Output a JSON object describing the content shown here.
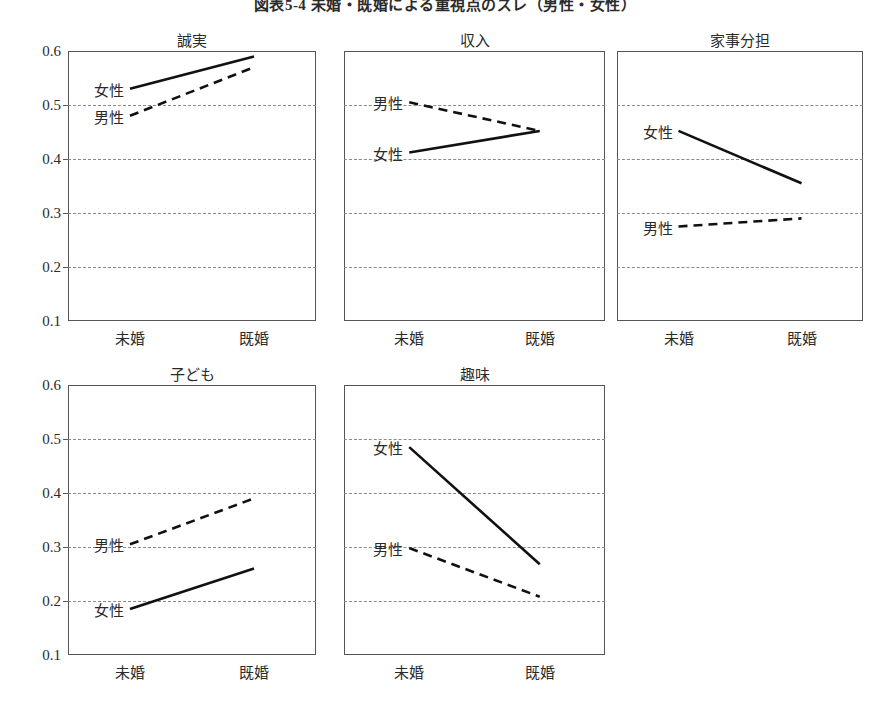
{
  "figure": {
    "title": "図表5-4 未婚・既婚による重視点のズレ（男性・女性）",
    "title_visible": "図表5-4 未婚・既婚による重視点のズレ（男性・女性）"
  },
  "axis": {
    "y_ticks": [
      "0.6",
      "0.5",
      "0.4",
      "0.3",
      "0.2",
      "0.1"
    ],
    "y_values": [
      0.6,
      0.5,
      0.4,
      0.3,
      0.2,
      0.1
    ],
    "y_min": 0.1,
    "y_max": 0.6,
    "x_categories": [
      "未婚",
      "既婚"
    ]
  },
  "series_names": {
    "female": "女性",
    "male": "男性"
  },
  "chart_data": {
    "type": "line",
    "title": "図表5-4 未婚・既婚による重視点のズレ（男性・女性）",
    "xlabel": "",
    "ylabel": "",
    "ylim": [
      0.1,
      0.6
    ],
    "grid": true,
    "legend_position": "inline-labels",
    "categories": [
      "未婚",
      "既婚"
    ],
    "panels": [
      {
        "title": "誠実",
        "series": [
          {
            "name": "女性",
            "style": "solid",
            "values": [
              0.53,
              0.59
            ]
          },
          {
            "name": "男性",
            "style": "dashed",
            "values": [
              0.48,
              0.57
            ]
          }
        ]
      },
      {
        "title": "収入",
        "series": [
          {
            "name": "男性",
            "style": "dashed",
            "values": [
              0.505,
              0.452
            ]
          },
          {
            "name": "女性",
            "style": "solid",
            "values": [
              0.412,
              0.452
            ]
          }
        ]
      },
      {
        "title": "家事分担",
        "series": [
          {
            "name": "女性",
            "style": "solid",
            "values": [
              0.452,
              0.355
            ]
          },
          {
            "name": "男性",
            "style": "dashed",
            "values": [
              0.275,
              0.29
            ]
          }
        ]
      },
      {
        "title": "子ども",
        "series": [
          {
            "name": "男性",
            "style": "dashed",
            "values": [
              0.305,
              0.39
            ]
          },
          {
            "name": "女性",
            "style": "solid",
            "values": [
              0.185,
              0.26
            ]
          }
        ]
      },
      {
        "title": "趣味",
        "series": [
          {
            "name": "女性",
            "style": "solid",
            "values": [
              0.485,
              0.268
            ]
          },
          {
            "name": "男性",
            "style": "dashed",
            "values": [
              0.298,
              0.208
            ]
          }
        ]
      }
    ]
  },
  "layout": {
    "panels": [
      {
        "left": 68,
        "top": 51,
        "width": 248,
        "height": 270
      },
      {
        "left": 344,
        "top": 51,
        "width": 261,
        "height": 270
      },
      {
        "left": 617,
        "top": 51,
        "width": 246,
        "height": 270
      },
      {
        "left": 68,
        "top": 385,
        "width": 248,
        "height": 270
      },
      {
        "left": 344,
        "top": 385,
        "width": 261,
        "height": 270
      }
    ],
    "x_positions": [
      0.25,
      0.75
    ],
    "show_y_axis": [
      true,
      false,
      false,
      true,
      false
    ]
  }
}
